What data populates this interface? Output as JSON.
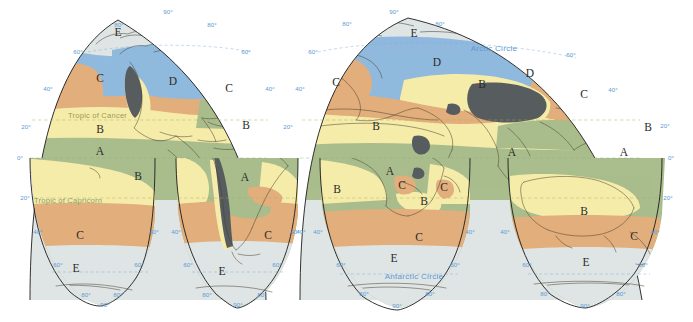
{
  "map": {
    "projection_name": "Goode homolosine interrupted",
    "background_color": "#ffffff",
    "outline_color": "#1c1c1c",
    "annotations": {
      "arctic_circle": "Arctic Circle",
      "antarctic_circle": "Antarctic Circle",
      "tropic_of_cancer": "Tropic of Cancer",
      "tropic_of_capricorn": "Tropic of Capricorn"
    },
    "legend_colors": {
      "A": "#a9bd8d",
      "B": "#f6ecaa",
      "C": "#e2ae7c",
      "D": "#91b9de",
      "E": "#dfe5e5",
      "highland": "#585c5e",
      "graticule": "#5b9ad4",
      "tropic_text": "#9a9a55",
      "capricorn_text": "#86a06a"
    },
    "zone_labels": [
      {
        "letter": "E",
        "x": 118,
        "y": 33
      },
      {
        "letter": "C",
        "x": 100,
        "y": 79
      },
      {
        "letter": "D",
        "x": 173,
        "y": 82
      },
      {
        "letter": "C",
        "x": 229,
        "y": 89
      },
      {
        "letter": "B",
        "x": 100,
        "y": 130
      },
      {
        "letter": "B",
        "x": 246,
        "y": 126
      },
      {
        "letter": "A",
        "x": 100,
        "y": 152
      },
      {
        "letter": "B",
        "x": 138,
        "y": 177
      },
      {
        "letter": "A",
        "x": 245,
        "y": 178
      },
      {
        "letter": "C",
        "x": 80,
        "y": 236
      },
      {
        "letter": "C",
        "x": 268,
        "y": 236
      },
      {
        "letter": "E",
        "x": 76,
        "y": 269
      },
      {
        "letter": "E",
        "x": 222,
        "y": 272
      },
      {
        "letter": "E",
        "x": 414,
        "y": 34
      },
      {
        "letter": "D",
        "x": 437,
        "y": 63
      },
      {
        "letter": "C",
        "x": 336,
        "y": 83
      },
      {
        "letter": "B",
        "x": 482,
        "y": 85
      },
      {
        "letter": "D",
        "x": 530,
        "y": 74
      },
      {
        "letter": "C",
        "x": 584,
        "y": 95
      },
      {
        "letter": "B",
        "x": 376,
        "y": 127
      },
      {
        "letter": "A",
        "x": 512,
        "y": 153
      },
      {
        "letter": "A",
        "x": 624,
        "y": 153
      },
      {
        "letter": "B",
        "x": 648,
        "y": 128
      },
      {
        "letter": "A",
        "x": 390,
        "y": 172
      },
      {
        "letter": "C",
        "x": 402,
        "y": 186
      },
      {
        "letter": "C",
        "x": 444,
        "y": 188
      },
      {
        "letter": "B",
        "x": 424,
        "y": 202
      },
      {
        "letter": "B",
        "x": 337,
        "y": 190
      },
      {
        "letter": "C",
        "x": 419,
        "y": 238
      },
      {
        "letter": "B",
        "x": 584,
        "y": 212
      },
      {
        "letter": "C",
        "x": 634,
        "y": 237
      },
      {
        "letter": "E",
        "x": 394,
        "y": 259
      },
      {
        "letter": "E",
        "x": 586,
        "y": 263
      }
    ],
    "latitude_labels": [
      {
        "text": "90°",
        "x": 168,
        "y": 12
      },
      {
        "text": "80°",
        "x": 119,
        "y": 25
      },
      {
        "text": "80°",
        "x": 212,
        "y": 25
      },
      {
        "text": "60°",
        "x": 78,
        "y": 52
      },
      {
        "text": "60°",
        "x": 246,
        "y": 52
      },
      {
        "text": "40°",
        "x": 48,
        "y": 89
      },
      {
        "text": "40°",
        "x": 270,
        "y": 89
      },
      {
        "text": "20°",
        "x": 26,
        "y": 127
      },
      {
        "text": "20°",
        "x": 288,
        "y": 127
      },
      {
        "text": "0°",
        "x": 20,
        "y": 158
      },
      {
        "text": "20°",
        "x": 25,
        "y": 198
      },
      {
        "text": "40°",
        "x": 38,
        "y": 232
      },
      {
        "text": "40°",
        "x": 154,
        "y": 232
      },
      {
        "text": "40°",
        "x": 176,
        "y": 232
      },
      {
        "text": "40°",
        "x": 295,
        "y": 232
      },
      {
        "text": "60°",
        "x": 58,
        "y": 265
      },
      {
        "text": "60°",
        "x": 139,
        "y": 265
      },
      {
        "text": "60°",
        "x": 188,
        "y": 265
      },
      {
        "text": "60°",
        "x": 277,
        "y": 265
      },
      {
        "text": "80°",
        "x": 86,
        "y": 295
      },
      {
        "text": "80°",
        "x": 118,
        "y": 295
      },
      {
        "text": "80°",
        "x": 207,
        "y": 295
      },
      {
        "text": "80°",
        "x": 262,
        "y": 295
      },
      {
        "text": "90°",
        "x": 105,
        "y": 305
      },
      {
        "text": "90°",
        "x": 238,
        "y": 305
      },
      {
        "text": "90°",
        "x": 394,
        "y": 12
      },
      {
        "text": "80°",
        "x": 347,
        "y": 24
      },
      {
        "text": "80°",
        "x": 440,
        "y": 24
      },
      {
        "text": "60°",
        "x": 313,
        "y": 52
      },
      {
        "text": "60°",
        "x": 571,
        "y": 55
      },
      {
        "text": "40°",
        "x": 300,
        "y": 89
      },
      {
        "text": "40°",
        "x": 613,
        "y": 90
      },
      {
        "text": "20°",
        "x": 665,
        "y": 126
      },
      {
        "text": "0°",
        "x": 671,
        "y": 158
      },
      {
        "text": "20°",
        "x": 668,
        "y": 198
      },
      {
        "text": "40°",
        "x": 301,
        "y": 232
      },
      {
        "text": "40°",
        "x": 318,
        "y": 232
      },
      {
        "text": "40°",
        "x": 470,
        "y": 232
      },
      {
        "text": "40°",
        "x": 505,
        "y": 232
      },
      {
        "text": "40°",
        "x": 655,
        "y": 232
      },
      {
        "text": "60°",
        "x": 341,
        "y": 265
      },
      {
        "text": "60°",
        "x": 455,
        "y": 265
      },
      {
        "text": "60°",
        "x": 527,
        "y": 265
      },
      {
        "text": "60°",
        "x": 643,
        "y": 265
      },
      {
        "text": "80°",
        "x": 364,
        "y": 294
      },
      {
        "text": "80°",
        "x": 430,
        "y": 294
      },
      {
        "text": "80°",
        "x": 545,
        "y": 294
      },
      {
        "text": "80°",
        "x": 621,
        "y": 294
      },
      {
        "text": "90°",
        "x": 397,
        "y": 306
      },
      {
        "text": "90°",
        "x": 585,
        "y": 306
      }
    ]
  }
}
